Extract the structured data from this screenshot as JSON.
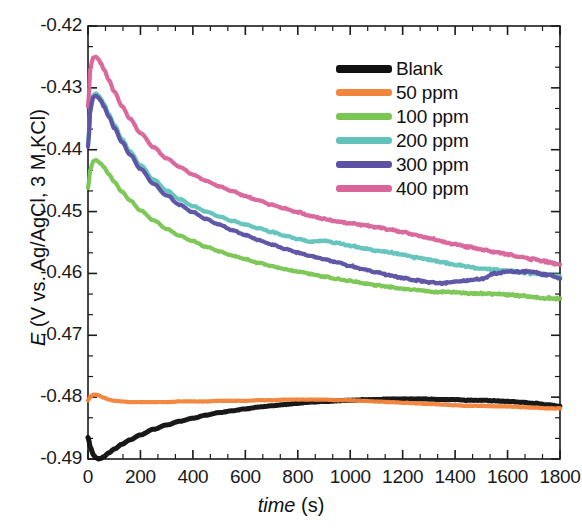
{
  "chart_data": {
    "type": "line",
    "title": "",
    "xlabel": "time (s)",
    "xlabel_symbol": "time",
    "xlabel_unit": "(s)",
    "ylabel": "E (V vs. Ag/AgCl, 3 M KCl)",
    "ylabel_symbol": "E",
    "ylabel_rest": "(V vs. Ag/AgCl, 3 M KCl)",
    "xlim": [
      0,
      1800
    ],
    "ylim": [
      -0.49,
      -0.42
    ],
    "xticks": [
      0,
      200,
      400,
      600,
      800,
      1000,
      1200,
      1400,
      1600,
      1800
    ],
    "xtick_labels": [
      "0",
      "200",
      "400",
      "600",
      "800",
      "1000",
      "1200",
      "1400",
      "1600",
      "1800"
    ],
    "yticks": [
      -0.42,
      -0.43,
      -0.44,
      -0.45,
      -0.46,
      -0.47,
      -0.48,
      -0.49
    ],
    "ytick_labels": [
      "-0.42",
      "-0.43",
      "-0.44",
      "-0.45",
      "-0.46",
      "-0.47",
      "-0.48",
      "-0.49"
    ],
    "minor_ticks_per_interval": 2,
    "grid": false,
    "legend_position": "top-right",
    "frame": true,
    "series": [
      {
        "name": "Blank",
        "color": "#111111",
        "x": [
          0,
          10,
          20,
          30,
          40,
          50,
          60,
          80,
          100,
          130,
          160,
          200,
          250,
          300,
          350,
          400,
          450,
          500,
          550,
          600,
          650,
          700,
          750,
          800,
          850,
          900,
          950,
          1000,
          1050,
          1100,
          1150,
          1200,
          1250,
          1300,
          1350,
          1400,
          1450,
          1500,
          1550,
          1600,
          1650,
          1700,
          1750,
          1800
        ],
        "y": [
          -0.4865,
          -0.4882,
          -0.4893,
          -0.4898,
          -0.49,
          -0.4899,
          -0.4896,
          -0.489,
          -0.4884,
          -0.4876,
          -0.4869,
          -0.4861,
          -0.4852,
          -0.4845,
          -0.4839,
          -0.4834,
          -0.4829,
          -0.4825,
          -0.4822,
          -0.4819,
          -0.4816,
          -0.4814,
          -0.4812,
          -0.481,
          -0.4808,
          -0.4807,
          -0.4806,
          -0.4805,
          -0.4804,
          -0.4804,
          -0.4803,
          -0.4803,
          -0.4803,
          -0.4803,
          -0.4804,
          -0.4804,
          -0.4805,
          -0.4805,
          -0.4806,
          -0.4807,
          -0.4808,
          -0.481,
          -0.4812,
          -0.4815
        ]
      },
      {
        "name": "50 ppm",
        "color": "#F2843C",
        "x": [
          0,
          10,
          20,
          30,
          40,
          50,
          60,
          80,
          100,
          130,
          160,
          200,
          250,
          300,
          350,
          400,
          450,
          500,
          550,
          600,
          650,
          700,
          750,
          800,
          850,
          900,
          950,
          1000,
          1050,
          1100,
          1150,
          1200,
          1250,
          1300,
          1350,
          1400,
          1450,
          1500,
          1550,
          1600,
          1650,
          1700,
          1750,
          1800
        ],
        "y": [
          -0.4805,
          -0.4799,
          -0.4796,
          -0.4796,
          -0.4797,
          -0.4799,
          -0.4801,
          -0.4804,
          -0.4806,
          -0.4807,
          -0.4808,
          -0.4808,
          -0.4808,
          -0.4808,
          -0.4807,
          -0.4807,
          -0.4807,
          -0.4806,
          -0.4806,
          -0.4806,
          -0.4805,
          -0.4805,
          -0.4804,
          -0.4804,
          -0.4804,
          -0.4804,
          -0.4805,
          -0.4805,
          -0.4806,
          -0.4807,
          -0.4808,
          -0.4809,
          -0.481,
          -0.4811,
          -0.4812,
          -0.4813,
          -0.4814,
          -0.4814,
          -0.4815,
          -0.4815,
          -0.4816,
          -0.4817,
          -0.4818,
          -0.4818
        ]
      },
      {
        "name": "100 ppm",
        "color": "#79C653",
        "x": [
          0,
          10,
          20,
          30,
          40,
          50,
          60,
          80,
          100,
          130,
          160,
          200,
          250,
          300,
          350,
          400,
          450,
          500,
          550,
          600,
          650,
          700,
          750,
          800,
          850,
          900,
          950,
          1000,
          1050,
          1100,
          1150,
          1200,
          1250,
          1300,
          1350,
          1400,
          1450,
          1500,
          1550,
          1600,
          1650,
          1700,
          1750,
          1800
        ],
        "y": [
          -0.4462,
          -0.443,
          -0.4419,
          -0.4417,
          -0.4419,
          -0.4423,
          -0.4428,
          -0.444,
          -0.4452,
          -0.4468,
          -0.4482,
          -0.4498,
          -0.4514,
          -0.4528,
          -0.4539,
          -0.4548,
          -0.4557,
          -0.4564,
          -0.4571,
          -0.4577,
          -0.4583,
          -0.4588,
          -0.4593,
          -0.4597,
          -0.4601,
          -0.4605,
          -0.4609,
          -0.4612,
          -0.4616,
          -0.4619,
          -0.4622,
          -0.4625,
          -0.4627,
          -0.4629,
          -0.463,
          -0.4631,
          -0.4632,
          -0.4632,
          -0.4633,
          -0.4634,
          -0.4636,
          -0.4638,
          -0.464,
          -0.4641
        ]
      },
      {
        "name": "200 ppm",
        "color": "#62C3BC",
        "x": [
          0,
          10,
          20,
          30,
          40,
          50,
          60,
          80,
          100,
          130,
          160,
          200,
          250,
          300,
          350,
          400,
          450,
          500,
          550,
          600,
          650,
          700,
          750,
          800,
          850,
          900,
          950,
          1000,
          1050,
          1100,
          1150,
          1200,
          1250,
          1300,
          1350,
          1400,
          1450,
          1500,
          1550,
          1600,
          1650,
          1700,
          1750,
          1800
        ],
        "y": [
          -0.4392,
          -0.433,
          -0.4312,
          -0.4309,
          -0.4312,
          -0.4318,
          -0.4326,
          -0.4343,
          -0.436,
          -0.4383,
          -0.4403,
          -0.4425,
          -0.4448,
          -0.4466,
          -0.448,
          -0.4491,
          -0.45,
          -0.4508,
          -0.4515,
          -0.4521,
          -0.4527,
          -0.4533,
          -0.4539,
          -0.4544,
          -0.4549,
          -0.4547,
          -0.4551,
          -0.4555,
          -0.4559,
          -0.4563,
          -0.4566,
          -0.457,
          -0.4574,
          -0.4578,
          -0.4582,
          -0.4586,
          -0.4589,
          -0.4592,
          -0.4594,
          -0.4596,
          -0.4598,
          -0.46,
          -0.4602,
          -0.4604
        ]
      },
      {
        "name": "300 ppm",
        "color": "#5B52A3",
        "x": [
          0,
          10,
          20,
          30,
          40,
          50,
          60,
          80,
          100,
          130,
          160,
          200,
          250,
          300,
          350,
          400,
          450,
          500,
          550,
          600,
          650,
          700,
          750,
          800,
          850,
          900,
          950,
          1000,
          1050,
          1100,
          1150,
          1200,
          1250,
          1300,
          1350,
          1400,
          1450,
          1500,
          1550,
          1600,
          1650,
          1700,
          1750,
          1800
        ],
        "y": [
          -0.4395,
          -0.4333,
          -0.4315,
          -0.4313,
          -0.4316,
          -0.4322,
          -0.433,
          -0.4347,
          -0.4365,
          -0.4388,
          -0.4408,
          -0.4431,
          -0.4455,
          -0.4474,
          -0.4489,
          -0.4501,
          -0.4512,
          -0.4521,
          -0.453,
          -0.4538,
          -0.4546,
          -0.4553,
          -0.456,
          -0.4566,
          -0.4572,
          -0.4577,
          -0.4582,
          -0.4588,
          -0.4593,
          -0.4598,
          -0.4603,
          -0.4607,
          -0.4611,
          -0.4614,
          -0.4616,
          -0.4613,
          -0.4611,
          -0.4609,
          -0.46,
          -0.4597,
          -0.4597,
          -0.4598,
          -0.4602,
          -0.4608
        ]
      },
      {
        "name": "400 ppm",
        "color": "#D9649B",
        "x": [
          0,
          10,
          20,
          30,
          40,
          50,
          60,
          80,
          100,
          130,
          160,
          200,
          250,
          300,
          350,
          400,
          450,
          500,
          550,
          600,
          650,
          700,
          750,
          800,
          850,
          900,
          950,
          1000,
          1050,
          1100,
          1150,
          1200,
          1250,
          1300,
          1350,
          1400,
          1450,
          1500,
          1550,
          1600,
          1650,
          1700,
          1750,
          1800
        ],
        "y": [
          -0.433,
          -0.4265,
          -0.4251,
          -0.425,
          -0.4254,
          -0.4261,
          -0.427,
          -0.4288,
          -0.4306,
          -0.433,
          -0.435,
          -0.4373,
          -0.4396,
          -0.4414,
          -0.4428,
          -0.444,
          -0.445,
          -0.4459,
          -0.4467,
          -0.4475,
          -0.4482,
          -0.4489,
          -0.4495,
          -0.4501,
          -0.4507,
          -0.4512,
          -0.4516,
          -0.4519,
          -0.4522,
          -0.4525,
          -0.4529,
          -0.4533,
          -0.4538,
          -0.4543,
          -0.4548,
          -0.4553,
          -0.4557,
          -0.4561,
          -0.4565,
          -0.4569,
          -0.4573,
          -0.4577,
          -0.4581,
          -0.4586
        ]
      }
    ]
  },
  "legend": {
    "items": [
      {
        "label": "Blank",
        "color": "#111111"
      },
      {
        "label": "50 ppm",
        "color": "#F2843C"
      },
      {
        "label": "100 ppm",
        "color": "#79C653"
      },
      {
        "label": "200 ppm",
        "color": "#62C3BC"
      },
      {
        "label": "300 ppm",
        "color": "#5B52A3"
      },
      {
        "label": "400 ppm",
        "color": "#D9649B"
      }
    ]
  },
  "plot_geometry": {
    "left": 88,
    "top": 26,
    "right": 560,
    "bottom": 459
  }
}
